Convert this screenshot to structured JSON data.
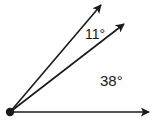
{
  "diagram": {
    "type": "angle-diagram",
    "colors": {
      "stroke": "#1a1a1a",
      "background": "#ffffff"
    },
    "vertex": {
      "x": 10,
      "y": 112
    },
    "rays": [
      {
        "name": "horizontal-ray",
        "tip": {
          "x": 150,
          "y": 112
        }
      },
      {
        "name": "middle-ray",
        "tip": {
          "x": 125,
          "y": 23
        }
      },
      {
        "name": "upper-ray",
        "tip": {
          "x": 102,
          "y": 4
        }
      }
    ],
    "angles": [
      {
        "label": "11°",
        "between": [
          "middle-ray",
          "upper-ray"
        ],
        "value": 11
      },
      {
        "label": "38°",
        "between": [
          "horizontal-ray",
          "middle-ray"
        ],
        "value": 38
      }
    ]
  }
}
